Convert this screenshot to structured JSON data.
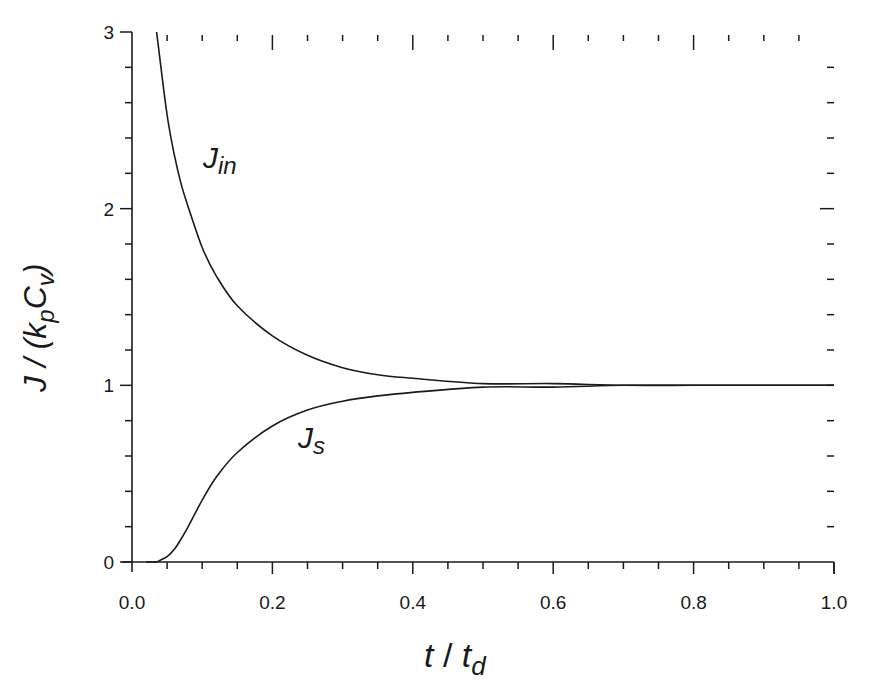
{
  "chart_data": {
    "type": "line",
    "title": "",
    "xlabel": "t / t_d",
    "ylabel": "J / (k_p C_v)",
    "xlim": [
      0.0,
      1.0
    ],
    "ylim": [
      0,
      3
    ],
    "grid": false,
    "legend": null,
    "x_ticks": [
      "0.0",
      "0.2",
      "0.4",
      "0.6",
      "0.8",
      "1.0"
    ],
    "x_tick_values": [
      0.0,
      0.2,
      0.4,
      0.6,
      0.8,
      1.0
    ],
    "x_minor_step": 0.05,
    "y_ticks": [
      "0",
      "1",
      "2",
      "3"
    ],
    "y_tick_values": [
      0,
      1,
      2,
      3
    ],
    "y_minor_step": 0.2,
    "x": [
      0.02,
      0.03,
      0.035,
      0.04,
      0.05,
      0.06,
      0.07,
      0.08,
      0.1,
      0.12,
      0.15,
      0.2,
      0.25,
      0.3,
      0.35,
      0.4,
      0.5,
      0.6,
      0.7,
      0.8,
      0.9,
      1.0
    ],
    "series": [
      {
        "name": "J_in",
        "label_main": "J",
        "label_sub": "in",
        "values": [
          null,
          null,
          3.02,
          2.84,
          2.53,
          2.31,
          2.14,
          2.01,
          1.78,
          1.62,
          1.45,
          1.28,
          1.17,
          1.1,
          1.06,
          1.04,
          1.01,
          1.01,
          1.0,
          1.0,
          1.0,
          1.0
        ]
      },
      {
        "name": "J_s",
        "label_main": "J",
        "label_sub": "s",
        "values": [
          0.0,
          0.0,
          0.0,
          0.01,
          0.03,
          0.07,
          0.13,
          0.2,
          0.35,
          0.48,
          0.62,
          0.77,
          0.86,
          0.91,
          0.94,
          0.96,
          0.99,
          0.99,
          1.0,
          1.0,
          1.0,
          1.0
        ]
      }
    ],
    "annotations": [
      {
        "text": "J_in",
        "x": 0.11,
        "y": 2.28
      },
      {
        "text": "J_s",
        "x": 0.245,
        "y": 0.67
      }
    ]
  },
  "labels": {
    "x_main": "t",
    "x_slash": " / ",
    "x_sub_main": "t",
    "x_sub": "d",
    "y_main": "J / (k",
    "y_sub_p": "p",
    "y_mid": "C",
    "y_sub_v": "v",
    "y_close": ")"
  }
}
